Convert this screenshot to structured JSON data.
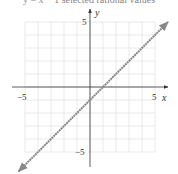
{
  "caption": "y = x − 1 selected rational values",
  "chart_data": {
    "type": "line",
    "title": "",
    "xlabel": "x",
    "ylabel": "y",
    "xlim": [
      -5,
      5
    ],
    "ylim": [
      -5,
      5
    ],
    "grid": true,
    "tick_labels": {
      "x_min": "−5",
      "x_max": "5",
      "y_max": "5",
      "y_min": "−5"
    },
    "series": [
      {
        "name": "y = x − 1",
        "x": [
          -5.5,
          6
        ],
        "y": [
          -6.5,
          5
        ],
        "color": "#888888",
        "arrows": "both"
      }
    ]
  }
}
